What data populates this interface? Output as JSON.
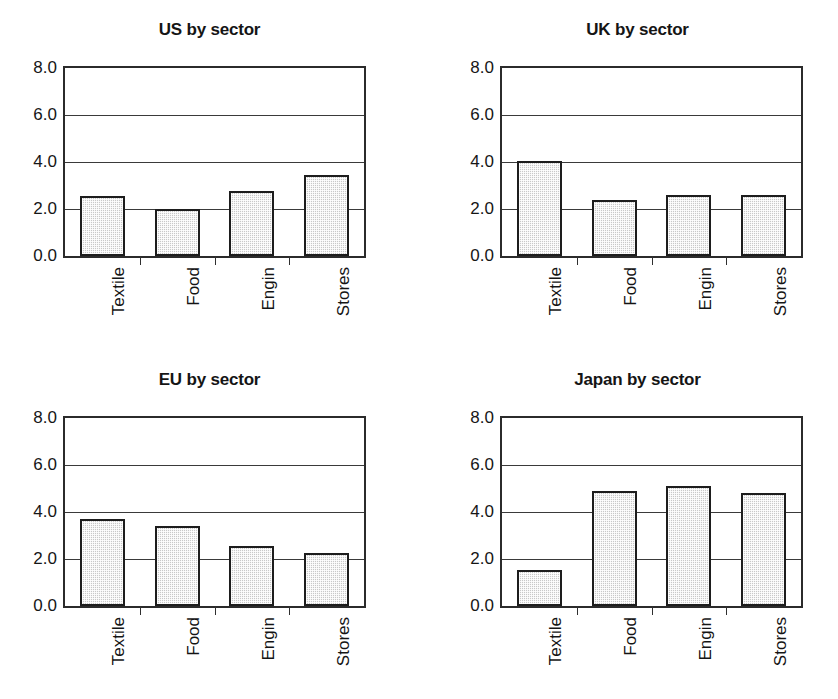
{
  "figure": {
    "background": "#ffffff",
    "bar_fill": "#c9c9c9",
    "bar_edge": "#1d1d1d",
    "axis_color": "#2b2b2b"
  },
  "chart_data": [
    {
      "type": "bar",
      "title": "US by sector",
      "categories": [
        "Textile",
        "Food",
        "Engin",
        "Stores"
      ],
      "values": [
        2.55,
        2.0,
        2.75,
        3.45
      ],
      "xlabel": "",
      "ylabel": "",
      "ylim": [
        0.0,
        8.0
      ],
      "yticks": [
        0.0,
        2.0,
        4.0,
        6.0,
        8.0
      ],
      "ytick_labels": [
        "0.0",
        "2.0",
        "4.0",
        "6.0",
        "8.0"
      ],
      "grid": true,
      "legend": "none"
    },
    {
      "type": "bar",
      "title": "UK by sector",
      "categories": [
        "Textile",
        "Food",
        "Engin",
        "Stores"
      ],
      "values": [
        4.05,
        2.4,
        2.6,
        2.6
      ],
      "xlabel": "",
      "ylabel": "",
      "ylim": [
        0.0,
        8.0
      ],
      "yticks": [
        0.0,
        2.0,
        4.0,
        6.0,
        8.0
      ],
      "ytick_labels": [
        "0.0",
        "2.0",
        "4.0",
        "6.0",
        "8.0"
      ],
      "grid": true,
      "legend": "none"
    },
    {
      "type": "bar",
      "title": "EU by sector",
      "categories": [
        "Textile",
        "Food",
        "Engin",
        "Stores"
      ],
      "values": [
        3.7,
        3.4,
        2.55,
        2.25
      ],
      "xlabel": "",
      "ylabel": "",
      "ylim": [
        0.0,
        8.0
      ],
      "yticks": [
        0.0,
        2.0,
        4.0,
        6.0,
        8.0
      ],
      "ytick_labels": [
        "0.0",
        "2.0",
        "4.0",
        "6.0",
        "8.0"
      ],
      "grid": true,
      "legend": "none"
    },
    {
      "type": "bar",
      "title": "Japan by sector",
      "categories": [
        "Textile",
        "Food",
        "Engin",
        "Stores"
      ],
      "values": [
        1.55,
        4.9,
        5.1,
        4.8
      ],
      "xlabel": "",
      "ylabel": "",
      "ylim": [
        0.0,
        8.0
      ],
      "yticks": [
        0.0,
        2.0,
        4.0,
        6.0,
        8.0
      ],
      "ytick_labels": [
        "0.0",
        "2.0",
        "4.0",
        "6.0",
        "8.0"
      ],
      "grid": true,
      "legend": "none"
    }
  ]
}
